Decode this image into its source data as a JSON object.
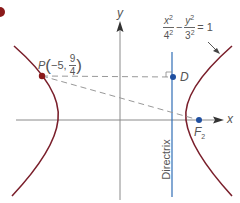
{
  "diagram": {
    "equation": {
      "x_num": "x",
      "x_exp": "2",
      "x_den": "4",
      "x_den_exp": "2",
      "minus": "−",
      "y_num": "y",
      "y_exp": "2",
      "y_den": "3",
      "y_den_exp": "2",
      "equals": "= 1"
    },
    "axes": {
      "x_label": "x",
      "y_label": "y"
    },
    "point_P": {
      "name": "P",
      "open": "(",
      "x": "−5,",
      "y_num": "9",
      "y_den": "4",
      "close": ")"
    },
    "point_D": {
      "name": "D"
    },
    "focus": {
      "name": "F",
      "sub": "2"
    },
    "directrix_label": "Directrix",
    "colors": {
      "curve": "#7a1f2b",
      "point_P": "#8b1a1a",
      "directrix": "#2f6db5",
      "point_blue": "#1f4fa0",
      "axis": "#8a8a8a",
      "dashed": "#999999",
      "corner_mark": "#e8a030"
    }
  }
}
